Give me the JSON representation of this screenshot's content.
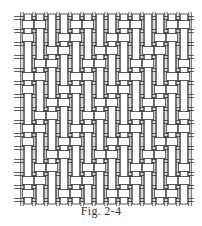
{
  "figure": {
    "caption": "Fig. 2-4",
    "stroke_color": "#333333",
    "fill_color": "#ffffff",
    "grid": {
      "x0": 22,
      "y0": 18,
      "x1": 190,
      "y1": 200,
      "columns": 14,
      "rows": 14,
      "strip_ratio": 0.62,
      "twill_shift": 1,
      "over_span": 2
    }
  }
}
